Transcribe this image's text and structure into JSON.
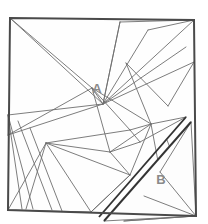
{
  "figure": {
    "kind": "geometric-dissection-diagram",
    "canvas": {
      "width": 208,
      "height": 224
    },
    "background_color": "#ffffff",
    "stroke_color": "#4a4a4a",
    "thin_stroke_color": "#6e6e6e",
    "thick_stroke_color": "#333333",
    "label_color": "#8a8a8a",
    "outer_square": {
      "name": "main-square",
      "points": "10,18 194,20 196,216 8,210",
      "stroke_width": 2
    },
    "cut_band": {
      "name": "thick-diagonal-cut",
      "line_a": "186,117 99,217",
      "line_b": "191,122 104,221",
      "stroke_width": 2
    },
    "region_b_outline": {
      "name": "region-b-boundary",
      "points": "191,122 196,216 104,221"
    },
    "labels": [
      {
        "id": "label-a",
        "text": "A",
        "x": 97,
        "y": 90
      },
      {
        "id": "label-b",
        "text": "B",
        "x": 161,
        "y": 181
      }
    ],
    "cut_lines": [
      {
        "id": "cut-1",
        "d": "M 10,18 L 103,104"
      },
      {
        "id": "cut-2",
        "d": "M 103,104 L 194,20"
      },
      {
        "id": "cut-3",
        "d": "M 103,104 L 186,47"
      },
      {
        "id": "cut-4",
        "d": "M 103,104 L 194,62"
      },
      {
        "id": "cut-5",
        "d": "M 103,104 L 148,30"
      },
      {
        "id": "cut-6",
        "d": "M 148,30 L 194,20"
      },
      {
        "id": "cut-7",
        "d": "M 103,104 L 120,22"
      },
      {
        "id": "cut-8",
        "d": "M 120,22 L 194,20"
      },
      {
        "id": "cut-9",
        "d": "M 10,18 L 92,88"
      },
      {
        "id": "cut-10",
        "d": "M 8,135 L 92,88"
      },
      {
        "id": "cut-11",
        "d": "M 8,135 L 103,104"
      },
      {
        "id": "cut-12",
        "d": "M 8,115 L 103,104"
      },
      {
        "id": "cut-13",
        "d": "M 92,88 L 130,130"
      },
      {
        "id": "cut-14",
        "d": "M 92,88 L 110,152"
      },
      {
        "id": "cut-15",
        "d": "M 92,88 L 151,124"
      },
      {
        "id": "cut-16",
        "d": "M 151,124 L 186,117"
      },
      {
        "id": "cut-17",
        "d": "M 126,63 L 151,124"
      },
      {
        "id": "cut-18",
        "d": "M 126,63 L 168,106"
      },
      {
        "id": "cut-19",
        "d": "M 168,106 L 194,62"
      },
      {
        "id": "cut-20",
        "d": "M 151,124 L 160,172"
      },
      {
        "id": "cut-21",
        "d": "M 46,143 L 130,130"
      },
      {
        "id": "cut-22",
        "d": "M 46,143 L 110,152"
      },
      {
        "id": "cut-23",
        "d": "M 46,143 L 130,175"
      },
      {
        "id": "cut-24",
        "d": "M 130,175 L 110,152"
      },
      {
        "id": "cut-25",
        "d": "M 46,143 L 91,212"
      },
      {
        "id": "cut-26",
        "d": "M 91,212 L 130,175"
      },
      {
        "id": "cut-27",
        "d": "M 46,143 L 8,210"
      },
      {
        "id": "cut-28",
        "d": "M 46,143 L 26,209"
      },
      {
        "id": "cut-29",
        "d": "M 8,115 L 33,209"
      },
      {
        "id": "cut-30",
        "d": "M 8,115 L 22,209"
      },
      {
        "id": "cut-31",
        "d": "M 18,121 L 52,210"
      },
      {
        "id": "cut-32",
        "d": "M 30,128 L 62,211"
      },
      {
        "id": "cut-33",
        "d": "M 91,212 L 130,175"
      },
      {
        "id": "cut-34",
        "d": "M 130,175 L 151,124"
      },
      {
        "id": "cut-35",
        "d": "M 196,216 L 160,172"
      },
      {
        "id": "cut-36",
        "d": "M 196,216 L 144,196"
      },
      {
        "id": "cut-37",
        "d": "M 196,216 L 124,221"
      },
      {
        "id": "cut-38",
        "d": "M 196,216 L 167,140"
      },
      {
        "id": "cut-39",
        "d": "M 160,172 L 191,122"
      },
      {
        "id": "cut-40",
        "d": "M 140,142 L 186,117"
      },
      {
        "id": "cut-41",
        "d": "M 8,210 L 91,212"
      },
      {
        "id": "cut-42",
        "d": "M 110,152 L 151,124"
      },
      {
        "id": "cut-43",
        "d": "M 130,130 L 151,124"
      },
      {
        "id": "cut-44",
        "d": "M 92,88 L 103,104"
      },
      {
        "id": "cut-45",
        "d": "M 120,22 L 103,104"
      },
      {
        "id": "cut-46",
        "d": "M 8,135 L 8,115"
      },
      {
        "id": "cut-47",
        "d": "M 130,130 L 140,142"
      },
      {
        "id": "cut-48",
        "d": "M 140,142 L 110,152"
      }
    ]
  }
}
